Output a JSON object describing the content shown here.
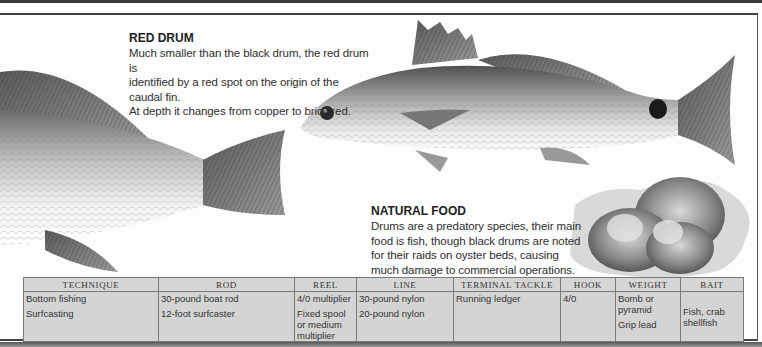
{
  "red_drum": {
    "title": "RED DRUM",
    "lines": [
      "Much smaller than the black drum, the red drum is",
      "identified by a red spot on the origin of the caudal fin.",
      "At depth it changes from  copper to brick red."
    ]
  },
  "natural_food": {
    "title": "NATURAL FOOD",
    "lines": [
      "Drums are a predatory species, their main",
      "food is fish, though black drums are noted",
      "for their raids on oyster beds, causing",
      "much damage to commercial operations."
    ]
  },
  "illustrations": {
    "black_drum_tail": "black-drum-tail-illustration",
    "red_drum": "red-drum-fish-illustration",
    "oysters": "oyster-cluster-illustration"
  },
  "colors": {
    "table_bg": "#d4d4d4",
    "table_border": "#7a7a7a",
    "text": "#2f2f2f",
    "frame": "#444444"
  },
  "table": {
    "headers": [
      "TECHNIQUE",
      "ROD",
      "REEL",
      "LINE",
      "TERMINAL TACKLE",
      "HOOK",
      "WEIGHT",
      "BAIT"
    ],
    "rows": [
      {
        "technique": "Bottom fishing",
        "rod": "30-pound boat rod",
        "reel": "4/0 multiplier",
        "line": "30-pound nylon",
        "terminal_tackle": "Running ledger",
        "hook": "4/0",
        "weight": "Bomb or pyramid",
        "bait": "Fish, crab shellfish"
      },
      {
        "technique": "Surfcasting",
        "rod": "12-foot surfcaster",
        "reel": "Fixed spool or medium multiplier",
        "line": "20-pound nylon",
        "terminal_tackle": "",
        "hook": "",
        "weight": "Grip lead",
        "bait": ""
      }
    ]
  }
}
